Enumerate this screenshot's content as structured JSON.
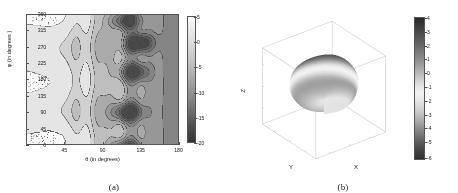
{
  "figure": {
    "background_color": "#ffffff",
    "panels": [
      {
        "caption": "(a)"
      },
      {
        "caption": "(b)"
      }
    ]
  },
  "panel_a": {
    "caption": "(a)",
    "xlabel": "θ (in degrees)",
    "ylabel": "φ (in degrees )",
    "xticks": [
      "45",
      "90",
      "135",
      "180"
    ],
    "yticks": [
      "0",
      "45",
      "90",
      "135",
      "180",
      "225",
      "270",
      "315",
      "360"
    ],
    "colorbar_ticks": [
      "5",
      "0",
      "-5",
      "-10",
      "-15",
      "-20"
    ]
  },
  "panel_b": {
    "caption": "(b)",
    "xlabel": "X",
    "ylabel": "Y",
    "zlabel": "Z",
    "colorbar_ticks": [
      "4",
      "3",
      "2",
      "1",
      "0",
      "-1",
      "-2",
      "-3",
      "-4",
      "-5",
      "-6"
    ]
  },
  "chart_data": [
    {
      "type": "heatmap",
      "panel": "(a)",
      "title": "",
      "xlabel": "θ (in degrees)",
      "ylabel": "φ (in degrees )",
      "xlim": [
        0,
        180
      ],
      "ylim": [
        0,
        360
      ],
      "xticks": [
        45,
        90,
        135,
        180
      ],
      "yticks": [
        0,
        45,
        90,
        135,
        180,
        225,
        270,
        315,
        360
      ],
      "colorbar": {
        "ticks": [
          5,
          0,
          -5,
          -10,
          -15,
          -20
        ],
        "vmin": -20,
        "vmax": 5,
        "colormap": "gray",
        "position": "right"
      },
      "grid": false,
      "legend": null,
      "description": "Filled contour map of gain (dB) over theta-phi angular space; low-gain (dark) nulls concentrated near theta 100-150 degrees at phi ~= 90, 180-230 and 300-340 degrees; broad light (high-gain) plateau for theta < 60 degrees.",
      "contour_levels": [
        5,
        0,
        -2.5,
        -5,
        -7.5,
        -10,
        -12.5,
        -15,
        -17.5,
        -20
      ],
      "notable_minima": [
        {
          "theta": 118,
          "phi": 345,
          "value": -18
        },
        {
          "theta": 133,
          "phi": 282,
          "value": -19
        },
        {
          "theta": 127,
          "phi": 200,
          "value": -17
        },
        {
          "theta": 120,
          "phi": 88,
          "value": -19
        }
      ],
      "notable_maxima": [
        {
          "theta": 22,
          "phi": 170,
          "value": 5
        },
        {
          "theta": 30,
          "phi": 355,
          "value": 4
        },
        {
          "theta": 35,
          "phi": 10,
          "value": 4
        }
      ]
    },
    {
      "type": "surface",
      "panel": "(b)",
      "title": "",
      "xlabel": "X",
      "ylabel": "Y",
      "zlabel": "Z",
      "colorbar": {
        "ticks": [
          4,
          3,
          2,
          1,
          0,
          -1,
          -2,
          -3,
          -4,
          -5,
          -6
        ],
        "vmin": -6,
        "vmax": 4,
        "colormap": "gray",
        "position": "right"
      },
      "grid": true,
      "legend": null,
      "description": "3-D radiation pattern rendered as a closed surface: broad dome in the upper hemisphere shaded dark (high values, ~2 to 4), a bright equatorial band near 0 to -1, and a dark downward-pointing lobe in the lower-right quadrant reaching the minimum near -6.",
      "surface_value_range": [
        -6,
        4
      ],
      "view": {
        "azimuth": -37.5,
        "elevation": 30
      }
    }
  ]
}
